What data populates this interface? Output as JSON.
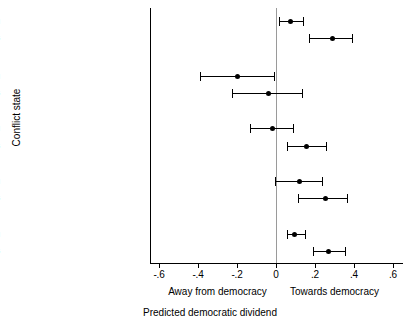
{
  "chart_data": {
    "type": "scatter",
    "title": "",
    "xlabel": "Predicted democratic dividend",
    "ylabel": "Conflict state",
    "xlim": [
      -0.7,
      0.7
    ],
    "xticks": [
      -0.6,
      -0.4,
      -0.2,
      0,
      0.2,
      0.4,
      0.6
    ],
    "xtick_labels": [
      "-.6",
      "-.4",
      "-.2",
      "0",
      ".2",
      ".4",
      ".6"
    ],
    "grid": false,
    "zero_reference_line": 0,
    "legend": "none",
    "annotations": {
      "left_direction": "Away from democracy",
      "right_direction": "Towards democracy"
    },
    "series_labels": [
      "avg",
      "1990s"
    ],
    "categories": [
      "Peace",
      "Conflict",
      "Recovery: year 1",
      "Recovery: year 2",
      "Recovery: years 3–10"
    ],
    "points": [
      {
        "category": "Peace",
        "series": "avg",
        "estimate": 0.076,
        "low": 0.015,
        "high": 0.137
      },
      {
        "category": "Peace",
        "series": "1990s",
        "estimate": 0.29,
        "low": 0.168,
        "high": 0.391
      },
      {
        "category": "Conflict",
        "series": "avg",
        "estimate": -0.198,
        "low": -0.391,
        "high": -0.01
      },
      {
        "category": "Conflict",
        "series": "1990s",
        "estimate": -0.041,
        "low": -0.224,
        "high": 0.132
      },
      {
        "category": "Recovery: year 1",
        "series": "avg",
        "estimate": -0.02,
        "low": -0.132,
        "high": 0.086
      },
      {
        "category": "Recovery: year 1",
        "series": "1990s",
        "estimate": 0.158,
        "low": 0.056,
        "high": 0.254
      },
      {
        "category": "Recovery: year 2",
        "series": "avg",
        "estimate": 0.122,
        "low": -0.005,
        "high": 0.234
      },
      {
        "category": "Recovery: year 2",
        "series": "1990s",
        "estimate": 0.254,
        "low": 0.112,
        "high": 0.366
      },
      {
        "category": "Recovery: years 3–10",
        "series": "avg",
        "estimate": 0.097,
        "low": 0.056,
        "high": 0.147
      },
      {
        "category": "Recovery: years 3–10",
        "series": "1990s",
        "estimate": 0.27,
        "low": 0.19,
        "high": 0.355
      }
    ]
  },
  "axes": {
    "y_title": "Conflict state",
    "x_title": "Predicted democratic dividend",
    "left_direction_label": "Away from democracy",
    "right_direction_label": "Towards democracy"
  },
  "colors": {
    "marker": "#000000",
    "axis": "#000000",
    "zero_line": "#9a9a9a",
    "background": "#ffffff"
  }
}
